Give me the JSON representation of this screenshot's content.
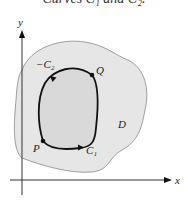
{
  "caption": "Curves C₁ and C₂.",
  "axes": {
    "x_label": "x",
    "y_label": "y"
  },
  "region": {
    "label": "D",
    "fill": "#e6e6e6",
    "inner_fill": "#d9d9d9",
    "stroke": "#777777"
  },
  "points": [
    {
      "label": "P"
    },
    {
      "label": "Q"
    }
  ],
  "curves": [
    {
      "label": "C₁"
    },
    {
      "label": "−C₂"
    }
  ],
  "colors": {
    "curve": "#111111",
    "axis": "#333333"
  }
}
